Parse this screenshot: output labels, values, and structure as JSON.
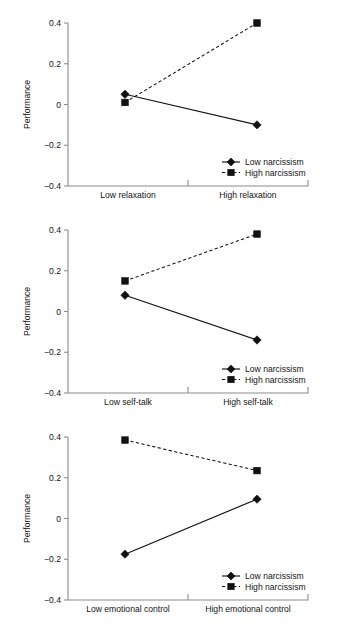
{
  "figure": {
    "title": "",
    "panel_count": 3
  },
  "chart_data": [
    {
      "type": "line",
      "title": "",
      "xlabel": "",
      "ylabel": "Performance",
      "categories": [
        "Low relaxation",
        "High relaxation"
      ],
      "ylim": [
        -0.4,
        0.4
      ],
      "yticks": [
        0.4,
        0.2,
        0,
        -0.2,
        -0.4
      ],
      "ytick_labels": [
        "0.4",
        "0.2",
        "0",
        "−0.2",
        "−0.4"
      ],
      "grid": false,
      "legend_position": "bottom-right",
      "series": [
        {
          "name": "Low narcissism",
          "values": [
            0.05,
            -0.1
          ],
          "style": "solid",
          "marker": "diamond"
        },
        {
          "name": "High narcissism",
          "values": [
            0.01,
            0.4
          ],
          "style": "dashed",
          "marker": "square"
        }
      ]
    },
    {
      "type": "line",
      "title": "",
      "xlabel": "",
      "ylabel": "Performance",
      "categories": [
        "Low self-talk",
        "High self-talk"
      ],
      "ylim": [
        -0.4,
        0.4
      ],
      "yticks": [
        0.4,
        0.2,
        0,
        -0.2,
        -0.4
      ],
      "ytick_labels": [
        "0.4",
        "0.2",
        "0",
        "−0.2",
        "−0.4"
      ],
      "grid": false,
      "legend_position": "bottom-right",
      "series": [
        {
          "name": "Low narcissism",
          "values": [
            0.08,
            -0.14
          ],
          "style": "solid",
          "marker": "diamond"
        },
        {
          "name": "High narcissism",
          "values": [
            0.15,
            0.38
          ],
          "style": "dashed",
          "marker": "square"
        }
      ]
    },
    {
      "type": "line",
      "title": "",
      "xlabel": "",
      "ylabel": "Performance",
      "categories": [
        "Low emotional control",
        "High emotional control"
      ],
      "ylim": [
        -0.4,
        0.4
      ],
      "yticks": [
        0.4,
        0.2,
        0,
        -0.2,
        -0.4
      ],
      "ytick_labels": [
        "0.4",
        "0.2",
        "0",
        "−0.2",
        "−0.4"
      ],
      "grid": false,
      "legend_position": "bottom-right",
      "series": [
        {
          "name": "Low narcissism",
          "values": [
            -0.175,
            0.095
          ],
          "style": "solid",
          "marker": "diamond"
        },
        {
          "name": "High narcissism",
          "values": [
            0.385,
            0.235
          ],
          "style": "dashed",
          "marker": "square"
        }
      ]
    }
  ],
  "colors": {
    "ink": "#111111",
    "axis": "#8c8c8c",
    "background": "#ffffff"
  }
}
